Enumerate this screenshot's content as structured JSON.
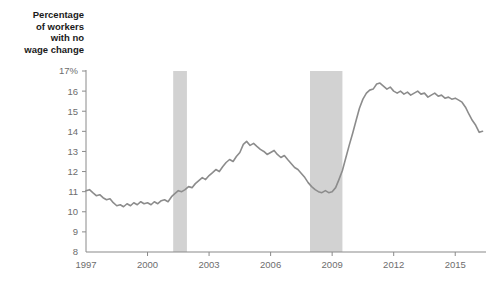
{
  "chart_data": {
    "type": "line",
    "title": "Percentage of workers with no wage change",
    "title_lines": [
      "Percentage",
      "of workers",
      "with no",
      "wage change"
    ],
    "xlabel": "",
    "ylabel": "",
    "ylim": [
      8,
      17
    ],
    "xlim": [
      1997.0,
      2016.5
    ],
    "grid": false,
    "legend": "none",
    "line_color": "#8c8c8c",
    "axis_color": "#8a8a8a",
    "tick_label_color": "#6d6d6d",
    "shaded_region_color": "#d2d2d2",
    "y_ticks": [
      8,
      9,
      10,
      11,
      12,
      13,
      14,
      15,
      16,
      17
    ],
    "y_tick_labels": [
      "8",
      "9",
      "10",
      "11",
      "12",
      "13",
      "14",
      "15",
      "16",
      "17%"
    ],
    "x_ticks": [
      1997,
      2000,
      2003,
      2006,
      2009,
      2012,
      2015
    ],
    "x_tick_labels": [
      "1997",
      "2000",
      "2003",
      "2006",
      "2009",
      "2012",
      "2015"
    ],
    "annotations": [
      {
        "label": "recession-band-1",
        "x_start": 2001.25,
        "x_end": 2001.92,
        "y_top": 17,
        "y_bottom": 8
      },
      {
        "label": "recession-band-2",
        "x_start": 2007.92,
        "x_end": 2009.5,
        "y_top": 17,
        "y_bottom": 8
      }
    ],
    "series": [
      {
        "name": "Percentage of workers with no wage change",
        "x": [
          1997.0,
          1997.17,
          1997.33,
          1997.5,
          1997.67,
          1997.83,
          1998.0,
          1998.17,
          1998.33,
          1998.5,
          1998.67,
          1998.83,
          1999.0,
          1999.17,
          1999.33,
          1999.5,
          1999.67,
          1999.83,
          2000.0,
          2000.17,
          2000.33,
          2000.5,
          2000.67,
          2000.83,
          2001.0,
          2001.17,
          2001.33,
          2001.5,
          2001.67,
          2001.83,
          2002.0,
          2002.17,
          2002.33,
          2002.5,
          2002.67,
          2002.83,
          2003.0,
          2003.17,
          2003.33,
          2003.5,
          2003.67,
          2003.83,
          2004.0,
          2004.17,
          2004.33,
          2004.5,
          2004.67,
          2004.83,
          2005.0,
          2005.17,
          2005.33,
          2005.5,
          2005.67,
          2005.83,
          2006.0,
          2006.17,
          2006.33,
          2006.5,
          2006.67,
          2006.83,
          2007.0,
          2007.17,
          2007.33,
          2007.5,
          2007.67,
          2007.83,
          2008.0,
          2008.17,
          2008.33,
          2008.5,
          2008.67,
          2008.83,
          2009.0,
          2009.17,
          2009.33,
          2009.5,
          2009.67,
          2009.83,
          2010.0,
          2010.17,
          2010.33,
          2010.5,
          2010.67,
          2010.83,
          2011.0,
          2011.17,
          2011.33,
          2011.5,
          2011.67,
          2011.83,
          2012.0,
          2012.17,
          2012.33,
          2012.5,
          2012.67,
          2012.83,
          2013.0,
          2013.17,
          2013.33,
          2013.5,
          2013.67,
          2013.83,
          2014.0,
          2014.17,
          2014.33,
          2014.5,
          2014.67,
          2014.83,
          2015.0,
          2015.17,
          2015.33,
          2015.5,
          2015.67,
          2015.83,
          2016.0,
          2016.17,
          2016.33
        ],
        "y": [
          11.05,
          11.1,
          10.95,
          10.8,
          10.85,
          10.7,
          10.6,
          10.65,
          10.45,
          10.3,
          10.35,
          10.25,
          10.4,
          10.3,
          10.45,
          10.35,
          10.5,
          10.4,
          10.45,
          10.35,
          10.5,
          10.4,
          10.55,
          10.6,
          10.5,
          10.75,
          10.9,
          11.05,
          11.0,
          11.1,
          11.25,
          11.2,
          11.4,
          11.55,
          11.7,
          11.6,
          11.8,
          11.95,
          12.1,
          12.0,
          12.25,
          12.45,
          12.6,
          12.5,
          12.75,
          12.95,
          13.35,
          13.5,
          13.3,
          13.4,
          13.25,
          13.1,
          13.0,
          12.85,
          12.95,
          13.05,
          12.85,
          12.7,
          12.8,
          12.6,
          12.4,
          12.2,
          12.1,
          11.9,
          11.7,
          11.45,
          11.25,
          11.1,
          11.0,
          10.95,
          11.05,
          10.95,
          11.0,
          11.2,
          11.6,
          12.05,
          12.7,
          13.3,
          13.9,
          14.55,
          15.15,
          15.6,
          15.9,
          16.05,
          16.1,
          16.35,
          16.4,
          16.25,
          16.1,
          16.2,
          16.0,
          15.9,
          16.0,
          15.85,
          15.95,
          15.8,
          15.9,
          16.0,
          15.85,
          15.9,
          15.7,
          15.8,
          15.9,
          15.75,
          15.8,
          15.65,
          15.7,
          15.6,
          15.65,
          15.55,
          15.45,
          15.2,
          14.85,
          14.55,
          14.3,
          13.95,
          14.0
        ]
      }
    ]
  }
}
